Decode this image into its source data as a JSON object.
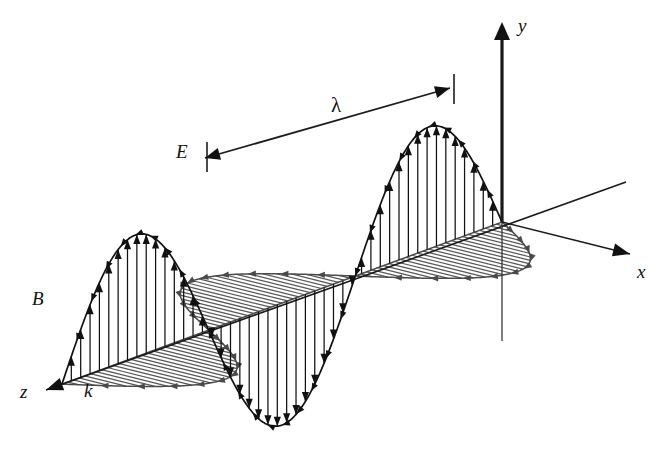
{
  "figure": {
    "background_color": "#ffffff",
    "labels": {
      "y_axis": "y",
      "x_axis": "x",
      "z_axis": "z",
      "wavevector": "k",
      "electric_field": "E",
      "magnetic_field": "B",
      "wavelength": "λ"
    },
    "colors": {
      "electric_field": "#111111",
      "magnetic_field": "#585858",
      "axes": "#1a1a1a",
      "annotation": "#1c1c1c"
    },
    "geometry": {
      "origin": {
        "x": 502,
        "y": 222
      },
      "y_axis_top": {
        "x": 502,
        "y": 22
      },
      "y_axis_bottom": {
        "x": 502,
        "y": 341
      },
      "x_axis_tip": {
        "x": 630,
        "y": 254
      },
      "z_axis_tip": {
        "x": 46,
        "y": 390
      },
      "z_axis_back_tip": {
        "x": 626,
        "y": 182
      },
      "e_peak_right": {
        "x": 450,
        "y": 92
      },
      "e_peak_left": {
        "x": 205,
        "y": 163
      },
      "e_trough": {
        "x": 336,
        "y": 430
      },
      "b_lobe_left_tip": {
        "x": 66,
        "y": 326
      },
      "lambda_arrow_start": {
        "x": 450,
        "y": 88
      },
      "lambda_arrow_end": {
        "x": 205,
        "y": 158
      },
      "lambda_label_pos": {
        "x": 331,
        "y": 112
      },
      "e_label_pos": {
        "x": 176,
        "y": 158
      },
      "b_label_pos": {
        "x": 32,
        "y": 305
      },
      "k_label_pos": {
        "x": 84,
        "y": 397
      },
      "z_label_pos": {
        "x": 20,
        "y": 398
      },
      "x_label_pos": {
        "x": 637,
        "y": 278
      },
      "y_label_pos": {
        "x": 518,
        "y": 32
      }
    }
  },
  "chart_data": {
    "type": "line",
    "xlabel": "z",
    "ylabel": "y",
    "zlabel": "x",
    "grid": false,
    "legend": [
      "E",
      "B"
    ],
    "legend_position": "inline-annotations",
    "annotations": [
      {
        "text": "λ",
        "meaning": "wavelength between successive E crests"
      },
      {
        "text": "k",
        "meaning": "propagation direction / wavevector along z"
      },
      {
        "text": "E",
        "meaning": "electric field vector, along y"
      },
      {
        "text": "B",
        "meaning": "magnetic field vector, along x"
      }
    ],
    "axes": [
      "x",
      "y",
      "z"
    ],
    "x": [
      0.0,
      0.05,
      0.1,
      0.15,
      0.2,
      0.25,
      0.3,
      0.35,
      0.4,
      0.45,
      0.5,
      0.55,
      0.6,
      0.65,
      0.7,
      0.75,
      0.8,
      0.85,
      0.9,
      0.95,
      1.0,
      1.05,
      1.1,
      1.15,
      1.2,
      1.25,
      1.3,
      1.35,
      1.4,
      1.45,
      1.5
    ],
    "x_unit": "wavelengths",
    "series": [
      {
        "name": "E",
        "axis": "y",
        "color": "#111111",
        "amplitude": 1.0,
        "phase": 0.0,
        "cycles": 1.5,
        "values": [
          0.0,
          0.309,
          0.588,
          0.809,
          0.951,
          1.0,
          0.951,
          0.809,
          0.588,
          0.309,
          0.0,
          -0.309,
          -0.588,
          -0.809,
          -0.951,
          -1.0,
          -0.951,
          -0.809,
          -0.588,
          -0.309,
          0.0,
          0.309,
          0.588,
          0.809,
          0.951,
          1.0,
          0.951,
          0.809,
          0.588,
          0.309,
          0.0
        ]
      },
      {
        "name": "B",
        "axis": "x",
        "color": "#585858",
        "amplitude": 1.0,
        "phase": 0.0,
        "cycles": 1.5,
        "values": [
          0.0,
          0.309,
          0.588,
          0.809,
          0.951,
          1.0,
          0.951,
          0.809,
          0.588,
          0.309,
          0.0,
          -0.309,
          -0.588,
          -0.809,
          -0.951,
          -1.0,
          -0.951,
          -0.809,
          -0.588,
          -0.309,
          0.0,
          0.309,
          0.588,
          0.809,
          0.951,
          1.0,
          0.951,
          0.809,
          0.588,
          0.309,
          0.0
        ]
      }
    ],
    "wavelength_marker": {
      "label": "λ",
      "from_cycle": 0.25,
      "to_cycle": 1.25,
      "span_cycles": 1.0
    }
  }
}
